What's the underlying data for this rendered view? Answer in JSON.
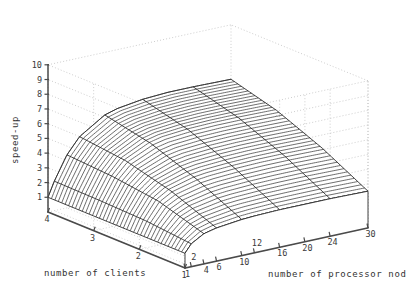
{
  "figure": {
    "background": "#ffffff",
    "ink": "#333333",
    "grid_color": "#b8b8b8"
  },
  "axes": {
    "z": {
      "title": "speed-up",
      "ticks": [
        "1",
        "2",
        "3",
        "4",
        "5",
        "6",
        "7",
        "8",
        "9",
        "10"
      ],
      "range": [
        0,
        10
      ]
    },
    "x_left": {
      "title": "number of clients",
      "ticks": [
        "4",
        "3",
        "2",
        "1"
      ],
      "range": [
        1,
        4
      ]
    },
    "y_right": {
      "title": "number of processor nod",
      "ticks": [
        "1",
        "2",
        "4",
        "6",
        "10",
        "12",
        "16",
        "20",
        "24",
        "30"
      ],
      "range": [
        1,
        30
      ]
    }
  },
  "chart_data": {
    "type": "surface",
    "title": "",
    "xlabel": "number of clients",
    "ylabel": "number of processor nod",
    "zlabel": "speed-up",
    "xlim": [
      1,
      4
    ],
    "ylim": [
      1,
      30
    ],
    "zlim": [
      0,
      10
    ],
    "grid": true,
    "legend": "none",
    "x_categories": [
      1,
      2,
      3,
      4
    ],
    "y_values": [
      1,
      2,
      4,
      6,
      10,
      12,
      16,
      20,
      24,
      30
    ],
    "series": [
      {
        "name": "clients = 1",
        "values": [
          1.0,
          1.55,
          2.05,
          2.25,
          2.45,
          2.5,
          2.55,
          2.55,
          2.55,
          2.5
        ]
      },
      {
        "name": "clients = 2",
        "values": [
          1.0,
          1.85,
          3.0,
          3.5,
          3.95,
          4.05,
          4.15,
          4.2,
          4.2,
          4.15
        ]
      },
      {
        "name": "clients = 3",
        "values": [
          1.0,
          1.95,
          3.4,
          4.3,
          5.1,
          5.3,
          5.45,
          5.5,
          5.5,
          5.45
        ]
      },
      {
        "name": "clients = 4",
        "values": [
          1.0,
          2.0,
          3.6,
          4.65,
          5.75,
          6.0,
          6.25,
          6.35,
          6.35,
          6.3
        ]
      }
    ],
    "mesh_rows_dense": 40
  }
}
